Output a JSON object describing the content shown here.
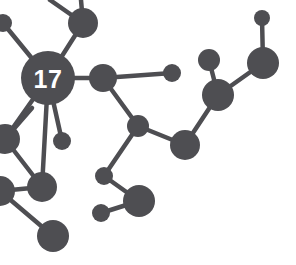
{
  "canvas": {
    "width": 296,
    "height": 265,
    "background_color": "#ffffff",
    "node_color": "#4e4e52",
    "edge_color": "#4e4e52",
    "label_color": "#ffffff"
  },
  "graph": {
    "title": "network-node-graph",
    "edge_width": 4.5,
    "hub_label": "17",
    "hub_label_font_size": 25,
    "nodes": [
      {
        "id": "n0",
        "name": "hub-node-17",
        "x": 48,
        "y": 78,
        "r": 27,
        "label": "17"
      },
      {
        "id": "n1",
        "name": "node-top-center",
        "x": 83,
        "y": 23,
        "r": 15,
        "label": ""
      },
      {
        "id": "n2",
        "name": "node-left-edge-top",
        "x": 3,
        "y": 23,
        "r": 9,
        "label": ""
      },
      {
        "id": "n3",
        "name": "node-mid-right-of-hub",
        "x": 103,
        "y": 78,
        "r": 14,
        "label": ""
      },
      {
        "id": "n4",
        "name": "node-small-right-arm",
        "x": 172,
        "y": 73,
        "r": 9,
        "label": ""
      },
      {
        "id": "n5",
        "name": "node-below-hub-small",
        "x": 62,
        "y": 141,
        "r": 9,
        "label": ""
      },
      {
        "id": "n6",
        "name": "node-left-edge-mid",
        "x": 5,
        "y": 139,
        "r": 15,
        "label": ""
      },
      {
        "id": "n7",
        "name": "node-lower-left-a",
        "x": 42,
        "y": 187,
        "r": 15,
        "label": ""
      },
      {
        "id": "n8",
        "name": "node-left-edge-lower",
        "x": 0,
        "y": 191,
        "r": 15,
        "label": ""
      },
      {
        "id": "n9",
        "name": "node-bottom-left",
        "x": 53,
        "y": 236,
        "r": 16,
        "label": ""
      },
      {
        "id": "n10",
        "name": "node-center-junction",
        "x": 138,
        "y": 126,
        "r": 11,
        "label": ""
      },
      {
        "id": "n11",
        "name": "node-center-lower-big",
        "x": 185,
        "y": 145,
        "r": 15,
        "label": ""
      },
      {
        "id": "n12",
        "name": "node-bottom-mid-small",
        "x": 104,
        "y": 176,
        "r": 9,
        "label": ""
      },
      {
        "id": "n13",
        "name": "node-bottom-mid-big",
        "x": 139,
        "y": 201,
        "r": 16,
        "label": ""
      },
      {
        "id": "n14",
        "name": "node-bottom-mid-tiny",
        "x": 101,
        "y": 213,
        "r": 9,
        "label": ""
      },
      {
        "id": "n15",
        "name": "node-right-junction",
        "x": 218,
        "y": 95,
        "r": 16,
        "label": ""
      },
      {
        "id": "n16",
        "name": "node-right-upper-small",
        "x": 209,
        "y": 60,
        "r": 11,
        "label": ""
      },
      {
        "id": "n17",
        "name": "node-right-big",
        "x": 263,
        "y": 63,
        "r": 16,
        "label": ""
      },
      {
        "id": "n18",
        "name": "node-top-right-tiny",
        "x": 262,
        "y": 18,
        "r": 8,
        "label": ""
      }
    ],
    "edges": [
      {
        "name": "edge-hub-to-top-center",
        "from": "n0",
        "to": "n1"
      },
      {
        "name": "edge-hub-to-left-edge-top",
        "from": "n0",
        "to": "n2"
      },
      {
        "name": "edge-hub-to-mid-right",
        "from": "n0",
        "to": "n3"
      },
      {
        "name": "edge-hub-to-below-small",
        "from": "n0",
        "to": "n5"
      },
      {
        "name": "edge-hub-to-left-edge-mid",
        "from": "n0",
        "to": "n6"
      },
      {
        "name": "edge-hub-to-lower-left-a",
        "from": "n0",
        "to": "n7"
      },
      {
        "name": "edge-mid-right-to-small-arm",
        "from": "n3",
        "to": "n4"
      },
      {
        "name": "edge-mid-right-to-junction",
        "from": "n3",
        "to": "n10"
      },
      {
        "name": "edge-junction-to-lower-big",
        "from": "n10",
        "to": "n11"
      },
      {
        "name": "edge-junction-to-bottom-small",
        "from": "n10",
        "to": "n12"
      },
      {
        "name": "edge-bottom-small-to-big",
        "from": "n12",
        "to": "n13"
      },
      {
        "name": "edge-bottom-big-to-tiny",
        "from": "n13",
        "to": "n14"
      },
      {
        "name": "edge-lower-big-to-right-junc",
        "from": "n11",
        "to": "n15"
      },
      {
        "name": "edge-right-junc-to-upper-sm",
        "from": "n15",
        "to": "n16"
      },
      {
        "name": "edge-right-junc-to-right-big",
        "from": "n15",
        "to": "n17"
      },
      {
        "name": "edge-right-big-to-tiny",
        "from": "n17",
        "to": "n18"
      },
      {
        "name": "edge-left-mid-to-lower-left",
        "from": "n6",
        "to": "n7"
      },
      {
        "name": "edge-lower-left-to-left-edge",
        "from": "n7",
        "to": "n8"
      },
      {
        "name": "edge-left-edge-to-bottom-left",
        "from": "n8",
        "to": "n9"
      },
      {
        "name": "edge-top-center-out-upleft",
        "from": "n1",
        "to": "stub_a"
      },
      {
        "name": "edge-top-center-out-up",
        "from": "n1",
        "to": "stub_b"
      },
      {
        "name": "edge-left-mid-out-upleft",
        "from": "n6",
        "to": "stub_c"
      },
      {
        "name": "edge-left-edge-lower-out",
        "from": "n8",
        "to": "stub_d"
      }
    ],
    "stubs": [
      {
        "id": "stub_a",
        "name": "stub-top-center-upleft",
        "x": 50,
        "y": 0
      },
      {
        "id": "stub_b",
        "name": "stub-top-center-up",
        "x": 81,
        "y": 0
      },
      {
        "id": "stub_c",
        "name": "stub-left-mid-upleft",
        "x": 32,
        "y": 108
      },
      {
        "id": "stub_d",
        "name": "stub-left-edge-lower",
        "x": 0,
        "y": 191
      }
    ]
  }
}
